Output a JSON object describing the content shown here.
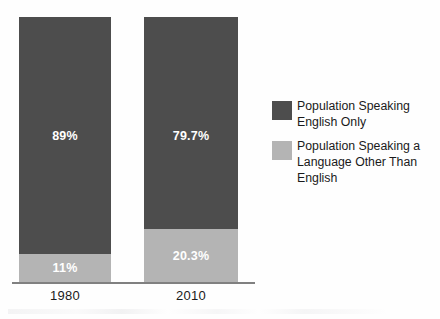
{
  "chart_data": {
    "type": "bar",
    "subtype": "stacked-100-percent",
    "title": "",
    "xlabel": "",
    "ylabel": "",
    "ylim": [
      0,
      100
    ],
    "grid": false,
    "legend_position": "right",
    "categories": [
      "1980",
      "2010"
    ],
    "series": [
      {
        "name": "Population Speaking English Only",
        "color": "#4d4d4d",
        "values": [
          89,
          79.7
        ],
        "labels": [
          "89%",
          "79.7%"
        ]
      },
      {
        "name": "Population Speaking a Language Other Than English",
        "color": "#b4b4b4",
        "values": [
          11,
          20.3
        ],
        "labels": [
          "11%",
          "20.3%"
        ]
      }
    ]
  },
  "axis": {
    "tick_labels": [
      "1980",
      "2010"
    ]
  },
  "legend": {
    "items": [
      {
        "label": "Population Speaking English Only",
        "color": "#4d4d4d"
      },
      {
        "label": "Population Speaking a Language Other Than English",
        "color": "#b4b4b4"
      }
    ]
  },
  "colors": {
    "dark_segment": "#4d4d4d",
    "light_segment": "#b4b4b4",
    "axis_line": "#808080",
    "label_text": "#ffffff",
    "tick_text": "#1a1a1a",
    "background": "#fefefe"
  }
}
